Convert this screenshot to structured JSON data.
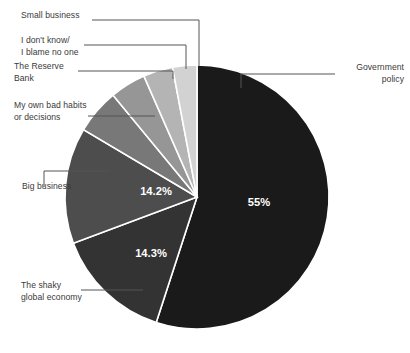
{
  "chart_data": {
    "type": "pie",
    "title": "",
    "subtitle": "",
    "xlabel": "",
    "ylabel": "",
    "legend_position": "callout-labels",
    "grid": false,
    "categories": [
      "Government policy",
      "The shaky global economy",
      "Big business",
      "My own bad habits or decisions",
      "The Reserve Bank",
      "I don't know/ I blame no one",
      "Small business"
    ],
    "values": [
      55,
      14.3,
      14.2,
      5.5,
      4.4,
      3.6,
      3.0
    ],
    "value_labels": [
      "55%",
      "14.3%",
      "14.2%",
      "",
      "",
      "",
      ""
    ],
    "colors": [
      "#1a1a1a",
      "#333333",
      "#4d4d4d",
      "#787878",
      "#969696",
      "#b4b4b4",
      "#d2d2d2"
    ],
    "start_angle_deg": 0,
    "direction": "clockwise"
  },
  "pie": {
    "center_x": 197,
    "center_y": 197,
    "radius": 132,
    "slices": [
      {
        "name": "government-policy",
        "label": "Government\npolicy",
        "value_label": "55%",
        "color": "#1a1a1a",
        "start": 0,
        "end": 198,
        "value_x": 259,
        "value_y": 206
      },
      {
        "name": "shaky-global-economy",
        "label": "The shaky\nglobal economy",
        "value_label": "14.3%",
        "color": "#333333",
        "start": 198,
        "end": 249.5,
        "value_x": 151,
        "value_y": 257
      },
      {
        "name": "big-business",
        "label": "Big business",
        "value_label": "14.2%",
        "color": "#4d4d4d",
        "start": 249.5,
        "end": 300.7,
        "value_x": 156,
        "value_y": 195
      },
      {
        "name": "my-own-bad-habits",
        "label": "My own bad habits\nor decisions",
        "value_label": "",
        "color": "#787878",
        "start": 300.7,
        "end": 320.5,
        "value_x": 0,
        "value_y": 0
      },
      {
        "name": "the-reserve-bank",
        "label": "The Reserve\nBank",
        "value_label": "",
        "color": "#969696",
        "start": 320.5,
        "end": 336.3,
        "value_x": 0,
        "value_y": 0
      },
      {
        "name": "i-dont-know",
        "label": "I don't know/\nI blame no one",
        "value_label": "",
        "color": "#b4b4b4",
        "start": 336.3,
        "end": 349.3,
        "value_x": 0,
        "value_y": 0
      },
      {
        "name": "small-business",
        "label": "Small business",
        "value_label": "",
        "color": "#d2d2d2",
        "start": 349.3,
        "end": 360,
        "value_x": 0,
        "value_y": 0
      }
    ],
    "separator_color": "#ffffff",
    "leader_color": "#555555"
  },
  "labels": {
    "small_business": "Small business",
    "i_dont_know": "I don't know/\nI blame no one",
    "reserve_bank": "The Reserve\nBank",
    "own_bad_habits": "My own bad habits\nor decisions",
    "big_business": "Big business",
    "shaky_global_economy": "The shaky\nglobal economy",
    "government_policy": "Government\npolicy"
  },
  "values": {
    "government_policy": "55%",
    "shaky_global_economy": "14.3%",
    "big_business": "14.2%"
  },
  "colors": {
    "text": "#3a3a3a",
    "leader": "#555555",
    "value_text": "#ffffff",
    "background": "#ffffff"
  }
}
